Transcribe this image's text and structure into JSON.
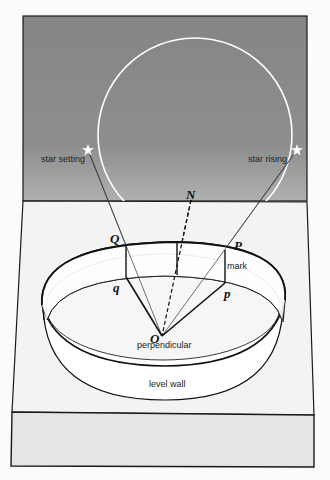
{
  "diagram": {
    "title": "",
    "type": "astronomical alignment diagram",
    "colors": {
      "sky": "#8a8a8a",
      "sky_light": "#a9a9a9",
      "ground_top": "#f2f2f2",
      "ground_side": "#e6e6e6",
      "outline": "#1a1a1a",
      "star_path": "#ffffff"
    },
    "sky": {
      "star_path_label": "",
      "stars": [
        {
          "id": "star-setting",
          "label": "star setting",
          "icon": "star-icon"
        },
        {
          "id": "star-rising",
          "label": "star rising",
          "icon": "star-icon"
        }
      ]
    },
    "points": {
      "N": "N",
      "Q": "Q",
      "P": "P",
      "q": "q",
      "p": "p",
      "O": "O"
    },
    "labels": {
      "mark": "mark",
      "perpendicular": "perpendicular",
      "level_wall": "level wall"
    }
  }
}
